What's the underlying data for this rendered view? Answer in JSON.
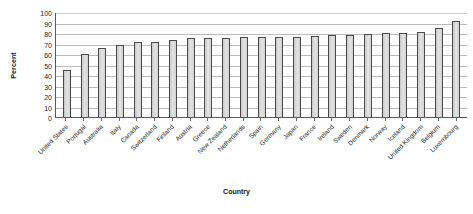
{
  "chart_data": {
    "type": "bar",
    "title": "",
    "xlabel": "Country",
    "ylabel": "Percent",
    "ylim": [
      0,
      100
    ],
    "ytick_step": 10,
    "yticks": [
      100,
      90,
      80,
      70,
      60,
      50,
      40,
      30,
      20,
      10,
      0
    ],
    "grid": true,
    "legend": "none",
    "bar_color": "#d9d9d9",
    "bar_border_color": "#4a4a4c",
    "categories": [
      "United States",
      "Portugal",
      "Australia",
      "Italy",
      "Canada",
      "Switzerland",
      "Finland",
      "Austria",
      "Greece",
      "New Zealand",
      "Netherlands",
      "Spain",
      "Germany",
      "Japan",
      "France",
      "Ireland",
      "Sweden",
      "Denmark",
      "Norway",
      "Iceland",
      "United Kingdom",
      "Belgium",
      "Luxembourg"
    ],
    "values": [
      45,
      60,
      66,
      69,
      71,
      71,
      73,
      75,
      75,
      75,
      76,
      76,
      76,
      76,
      77,
      78,
      78,
      79,
      80,
      80,
      81,
      85,
      91
    ]
  }
}
